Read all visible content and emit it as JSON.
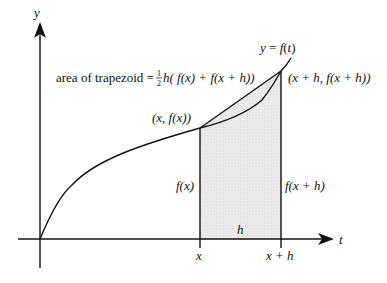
{
  "diagram": {
    "type": "trapezoid-rule-illustration",
    "axes": {
      "y_label": "y",
      "t_label": "t"
    },
    "curve_label": "y = f(t)",
    "formula": {
      "prefix": "area of trapezoid = ",
      "frac_num": "1",
      "frac_den": "2",
      "body": "h( f(x) + f(x + h))"
    },
    "points": {
      "left": "(x,  f(x))",
      "right": "(x + h,  f(x + h))"
    },
    "heights": {
      "left": "f(x)",
      "right": "f(x + h)"
    },
    "width_label": "h",
    "ticks": {
      "x": "x",
      "x_plus_h": "x + h"
    },
    "colors": {
      "line": "#111111",
      "shade": "#e6e6e6"
    }
  }
}
